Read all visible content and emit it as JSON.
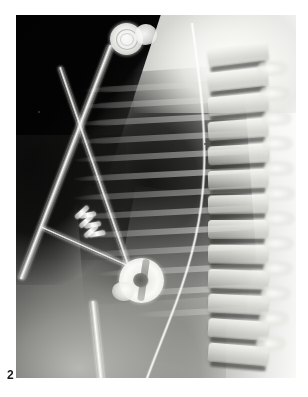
{
  "figure": {
    "label": "2",
    "modality": "radiograph",
    "view": "lateral chest x-ray",
    "caption_text": "2"
  },
  "plate": {
    "x": 16,
    "y": 15,
    "width": 280,
    "height": 363,
    "background_color": "#0a0a0a",
    "border_color": "#ffffff"
  },
  "anatomy": {
    "regions": [
      {
        "name": "lung-field",
        "description": "radiolucent lung field",
        "density": "dark"
      },
      {
        "name": "mediastinum",
        "description": "cardiac / mediastinal silhouette",
        "density": "mid-grey"
      },
      {
        "name": "diaphragm",
        "description": "diaphragm and upper abdomen",
        "density": "light-grey"
      },
      {
        "name": "shoulder-girdle",
        "description": "bright upper thoracic / shoulder soft tissue",
        "density": "bright"
      },
      {
        "name": "collimation-corner",
        "description": "unexposed collimated corner",
        "density": "black"
      }
    ],
    "ribs": {
      "name": "rib-cage",
      "count": 13,
      "bands": [
        {
          "top": 16,
          "left": 22,
          "width": 178
        },
        {
          "top": 32,
          "left": 18,
          "width": 186
        },
        {
          "top": 49,
          "left": 14,
          "width": 192
        },
        {
          "top": 67,
          "left": 10,
          "width": 196
        },
        {
          "top": 85,
          "left": 8,
          "width": 199
        },
        {
          "top": 104,
          "left": 6,
          "width": 201
        },
        {
          "top": 123,
          "left": 5,
          "width": 202
        },
        {
          "top": 142,
          "left": 6,
          "width": 201
        },
        {
          "top": 161,
          "left": 10,
          "width": 197
        },
        {
          "top": 180,
          "left": 16,
          "width": 191
        },
        {
          "top": 200,
          "left": 26,
          "width": 181
        },
        {
          "top": 221,
          "left": 42,
          "width": 165
        },
        {
          "top": 243,
          "left": 62,
          "width": 145
        }
      ]
    },
    "spine": {
      "name": "thoracic-spine",
      "vertebra_count": 13,
      "vertebrae": [
        {
          "top": 6,
          "rot": -7
        },
        {
          "top": 31,
          "rot": -6
        },
        {
          "top": 56,
          "rot": -5
        },
        {
          "top": 81,
          "rot": -4
        },
        {
          "top": 106,
          "rot": -3
        },
        {
          "top": 131,
          "rot": -2
        },
        {
          "top": 156,
          "rot": -1
        },
        {
          "top": 181,
          "rot": 0
        },
        {
          "top": 206,
          "rot": 1
        },
        {
          "top": 231,
          "rot": 2
        },
        {
          "top": 256,
          "rot": 3
        },
        {
          "top": 281,
          "rot": 4
        },
        {
          "top": 306,
          "rot": 5
        }
      ],
      "posterior_elements": [
        {
          "top": 22,
          "left": 56
        },
        {
          "top": 47,
          "left": 58
        },
        {
          "top": 72,
          "left": 60
        },
        {
          "top": 97,
          "left": 61
        },
        {
          "top": 122,
          "left": 62
        },
        {
          "top": 147,
          "left": 63
        },
        {
          "top": 172,
          "left": 63
        },
        {
          "top": 197,
          "left": 62
        },
        {
          "top": 222,
          "left": 61
        },
        {
          "top": 247,
          "left": 59
        },
        {
          "top": 272,
          "left": 57
        },
        {
          "top": 297,
          "left": 54
        }
      ]
    }
  },
  "devices": [
    {
      "name": "ecg-electrode",
      "label": "ECG electrode disc",
      "shape": "circle",
      "cx": 110,
      "cy": 24,
      "r": 16
    },
    {
      "name": "ecg-electrode-secondary",
      "label": "second electrode disc",
      "shape": "circle",
      "cx": 130,
      "cy": 20,
      "r": 11
    },
    {
      "name": "lead-wire-a",
      "label": "ECG lead wire (descending)",
      "shape": "line"
    },
    {
      "name": "lead-wire-b",
      "label": "crossing lead wire",
      "shape": "line"
    },
    {
      "name": "catheter-to-device",
      "label": "delivery catheter to occluder",
      "shape": "line"
    },
    {
      "name": "lower-catheter",
      "label": "lower catheter / drain",
      "shape": "line"
    },
    {
      "name": "fine-line",
      "label": "fine radiopaque line (central line)",
      "shape": "curve"
    },
    {
      "name": "embolization-coil",
      "label": "spring / embolization coil",
      "shape": "helix",
      "turns": 6,
      "cx": 79,
      "cy": 207
    },
    {
      "name": "occluder-device",
      "label": "radiopaque occluder device",
      "shape": "disc",
      "cx": 126,
      "cy": 266,
      "r": 23
    }
  ],
  "artifacts": [
    {
      "name": "film-speck",
      "x": 22,
      "y": 96
    },
    {
      "name": "film-speck",
      "x": 188,
      "y": 128
    },
    {
      "name": "film-speck",
      "x": 176,
      "y": 210
    }
  ],
  "colors": {
    "page_background": "#ffffff",
    "film_black": "#0a0a0a",
    "bone_white": "#fdfdfb",
    "metal_white": "#ffffff",
    "label_text": "#1a1a1a"
  }
}
